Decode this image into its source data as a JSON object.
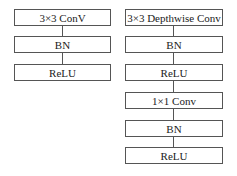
{
  "diagram": {
    "left_column": {
      "blocks": [
        {
          "label": "3×3 ConV"
        },
        {
          "label": "BN"
        },
        {
          "label": "ReLU"
        }
      ]
    },
    "right_column": {
      "blocks": [
        {
          "label": "3×3 Depthwise Conv"
        },
        {
          "label": "BN"
        },
        {
          "label": "ReLU"
        },
        {
          "label": "1×1 Conv"
        },
        {
          "label": "BN"
        },
        {
          "label": "ReLU"
        }
      ]
    },
    "colors": {
      "border": "#555555",
      "background": "#ffffff",
      "text": "#222222"
    }
  }
}
